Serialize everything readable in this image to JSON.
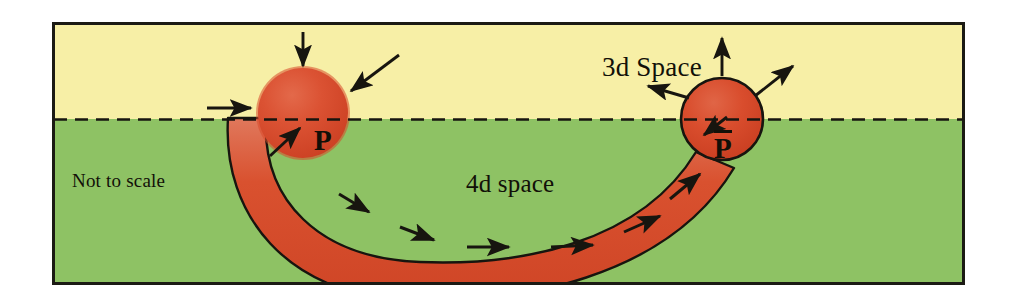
{
  "diagram": {
    "caption_not_to_scale": "Not to scale",
    "labels": {
      "upper_region": "3d Space",
      "lower_region": "4d space",
      "left_sphere": "P",
      "right_sphere": "P",
      "right_sphere_overbar": true
    },
    "colors": {
      "upper_region_fill": "#f7efa6",
      "lower_region_fill": "#8ec264",
      "sphere_fill": "#d9462c",
      "sphere_highlight": "#e8destroy",
      "tube_fill": "#d9462c",
      "outline": "#17150f",
      "frame": "#1b1a14",
      "text": "#121008",
      "page_background": "#ffffff"
    },
    "frame": {
      "x": 52,
      "y": 22,
      "width": 913,
      "height": 263,
      "border_width": 3
    },
    "horizon": {
      "y": 119,
      "style": "dashed",
      "description": "boundary between 3d space (above) and 4d space (below)"
    },
    "left_sphere": {
      "cx": 303,
      "cy": 113,
      "r": 46,
      "outlined": false,
      "arrow_direction": "inward",
      "arrow_count": 4
    },
    "right_sphere": {
      "cx": 722,
      "cy": 119,
      "r": 41,
      "outlined": true,
      "arrow_direction": "outward",
      "arrow_count": 4
    },
    "tube": {
      "shape": "u-arc",
      "flow_arrow_count": 6,
      "flow_direction": "left-to-right",
      "outlined": true
    }
  }
}
